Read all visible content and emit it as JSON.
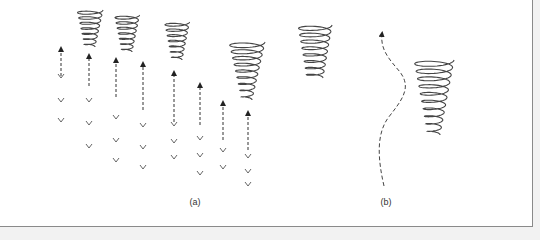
{
  "figure": {
    "panels": [
      {
        "id": "a",
        "label": "(a)",
        "x": 195,
        "y": 197
      },
      {
        "id": "b",
        "label": "(b)",
        "x": 386,
        "y": 197
      }
    ],
    "colors": {
      "stroke": "#444444",
      "frame": "#8a8a8a",
      "background": "#ffffff",
      "outside": "#f2f2f2"
    },
    "panel_a": {
      "description": "Updrafts (dashed upward arrows) beneath tornado-like spiral vortices, with downward chevrons below",
      "columns": [
        {
          "x": 61,
          "arrow_top": 46,
          "arrow_bottom": 76,
          "chevrons": [
            76,
            100,
            120
          ]
        },
        {
          "x": 89,
          "arrow_top": 53,
          "arrow_bottom": 86,
          "chevrons": [
            100,
            123,
            146
          ]
        },
        {
          "x": 116,
          "arrow_top": 57,
          "arrow_bottom": 97,
          "chevrons": [
            117,
            140,
            160
          ]
        },
        {
          "x": 143,
          "arrow_top": 61,
          "arrow_bottom": 110,
          "chevrons": [
            125,
            147,
            167
          ]
        },
        {
          "x": 174,
          "arrow_top": 70,
          "arrow_bottom": 122,
          "chevrons": [
            124,
            141,
            157
          ]
        },
        {
          "x": 200,
          "arrow_top": 82,
          "arrow_bottom": 125,
          "chevrons": [
            138,
            155,
            173
          ]
        },
        {
          "x": 223,
          "arrow_top": 100,
          "arrow_bottom": 140,
          "chevrons": [
            150,
            167
          ]
        },
        {
          "x": 248,
          "arrow_top": 110,
          "arrow_bottom": 150,
          "chevrons": [
            156,
            171,
            184
          ]
        }
      ],
      "spirals": [
        {
          "cx": 90,
          "top": 10,
          "bottom": 47,
          "wtop": 26,
          "wbot": 10,
          "turns": 7
        },
        {
          "cx": 127,
          "top": 15,
          "bottom": 52,
          "wtop": 25,
          "wbot": 10,
          "turns": 7
        },
        {
          "cx": 177,
          "top": 22,
          "bottom": 60,
          "wtop": 25,
          "wbot": 10,
          "turns": 7
        },
        {
          "cx": 247,
          "top": 42,
          "bottom": 100,
          "wtop": 36,
          "wbot": 10,
          "turns": 9
        },
        {
          "cx": 315,
          "top": 25,
          "bottom": 78,
          "wtop": 34,
          "wbot": 16,
          "turns": 8
        }
      ]
    },
    "panel_b": {
      "description": "Wavy dashed path rising next to a spiral vortex",
      "path": "M384,186 C378,160 376,135 388,118 C402,100 412,88 400,72 C390,60 380,50 382,34",
      "spiral": {
        "cx": 434,
        "top": 60,
        "bottom": 135,
        "wtop": 40,
        "wbot": 12,
        "turns": 10
      }
    }
  }
}
